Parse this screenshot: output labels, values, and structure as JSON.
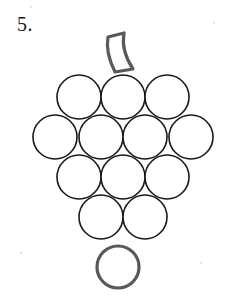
{
  "worksheet": {
    "problem_number": "5.",
    "background_color": "#ffffff"
  },
  "figure": {
    "name": "grape-bunch-line-drawing",
    "circle_stroke_color": "#1a1a1a",
    "circle_stroke_width": 1.6,
    "highlight_stroke_color": "#595959",
    "highlight_stroke_width": 3.2,
    "fill_color": "none",
    "stem": {
      "name": "grape-stem",
      "stroke_color": "#595959",
      "stroke_width": 3.2,
      "path": "M 108 37 L 124 33 C 122 44 125 57 133 69 L 115 72 C 109 60 106 48 108 37 Z"
    },
    "rows": [
      {
        "row_index": 1,
        "count": 3,
        "center_y": 97,
        "radius": 22,
        "centers_x": [
          79,
          123,
          167
        ],
        "emphasized": false
      },
      {
        "row_index": 2,
        "count": 4,
        "center_y": 137,
        "radius": 22,
        "centers_x": [
          55,
          101,
          145,
          191
        ],
        "emphasized": false
      },
      {
        "row_index": 3,
        "count": 3,
        "center_y": 177,
        "radius": 22,
        "centers_x": [
          79,
          123,
          167
        ],
        "emphasized": false
      },
      {
        "row_index": 4,
        "count": 2,
        "center_y": 217,
        "radius": 22,
        "centers_x": [
          101,
          145
        ],
        "emphasized": false
      },
      {
        "row_index": 5,
        "count": 1,
        "center_y": 267,
        "radius": 21,
        "centers_x": [
          118
        ],
        "emphasized": true
      }
    ],
    "total_circles": 13,
    "specks": [
      {
        "x": 30,
        "y": 6
      },
      {
        "x": 213,
        "y": 22
      },
      {
        "x": 20,
        "y": 252
      },
      {
        "x": 200,
        "y": 262
      }
    ]
  }
}
